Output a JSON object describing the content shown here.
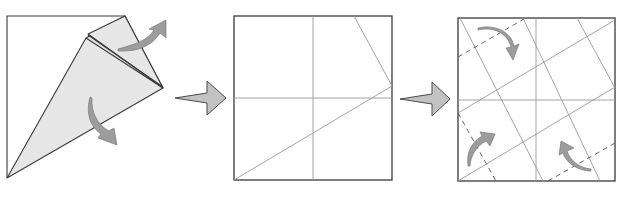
{
  "diagram": {
    "panels": [
      {
        "id": "step-1",
        "description": "Kite shape with flaps being unfolded"
      },
      {
        "id": "step-2",
        "description": "Unfolded square showing crease pattern"
      },
      {
        "id": "step-3",
        "description": "Square with parallel creases and valley-fold dashed lines, corners folding in"
      }
    ],
    "arrows": [
      {
        "from": "step-1",
        "to": "step-2"
      },
      {
        "from": "step-2",
        "to": "step-3"
      }
    ],
    "colors": {
      "paper_fill": "#e6e6e6",
      "outline": "#3a3a3a",
      "crease": "#9a9a9a",
      "curved_arrow": "#9c9c9c",
      "step_arrow": "#c2c2c2"
    }
  }
}
